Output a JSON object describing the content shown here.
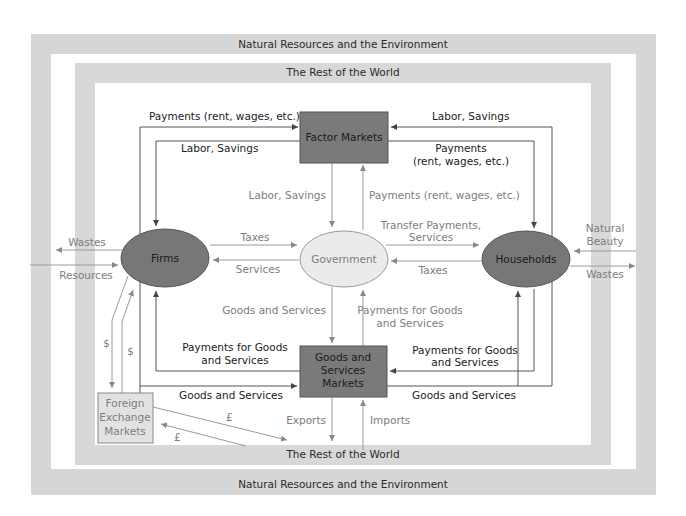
{
  "bands": {
    "outer_top": "Natural Resources and the Environment",
    "outer_bottom": "Natural Resources and the Environment",
    "inner_top": "The Rest of the World",
    "inner_bottom": "The Rest of the World"
  },
  "nodes": {
    "factor_markets": "Factor Markets",
    "firms": "Firms",
    "government": "Government",
    "households": "Households",
    "goods_markets": [
      "Goods and",
      "Services",
      "Markets"
    ],
    "forex": [
      "Foreign",
      "Exchange",
      "Markets"
    ]
  },
  "flows": {
    "firms_to_factor_payments": "Payments (rent, wages, etc.)",
    "factor_to_firms_labor": "Labor, Savings",
    "households_to_factor_labor": "Labor, Savings",
    "factor_to_households_payments": [
      "Payments",
      "(rent, wages, etc.)"
    ],
    "factor_to_gov_labor": "Labor, Savings",
    "gov_to_factor_payments": "Payments (rent, wages, etc.)",
    "firms_to_gov_taxes": "Taxes",
    "gov_to_firms_services": "Services",
    "gov_to_households_transfers": [
      "Transfer Payments,",
      "Services"
    ],
    "households_to_gov_taxes": "Taxes",
    "firms_wastes": "Wastes",
    "firms_resources": "Resources",
    "households_natural_beauty": [
      "Natural",
      "Beauty"
    ],
    "households_wastes": "Wastes",
    "goods_to_gov": "Goods and Services",
    "gov_payments_for_goods": [
      "Payments for Goods",
      "and Services"
    ],
    "firms_payments_for_goods": [
      "Payments for Goods",
      "and Services"
    ],
    "firms_goods_and_services": "Goods and Services",
    "households_payments_for_goods": [
      "Payments for Goods",
      "and Services"
    ],
    "households_goods_and_services": "Goods and Services",
    "exports": "Exports",
    "imports": "Imports",
    "dollar_1": "$",
    "dollar_2": "$",
    "pound_1": "£",
    "pound_2": "£"
  },
  "colors": {
    "band": "#d6d6d6",
    "node_dark": "#7a7a7a",
    "node_light": "#ebebeb",
    "forex_fill": "#e2e2e2"
  }
}
